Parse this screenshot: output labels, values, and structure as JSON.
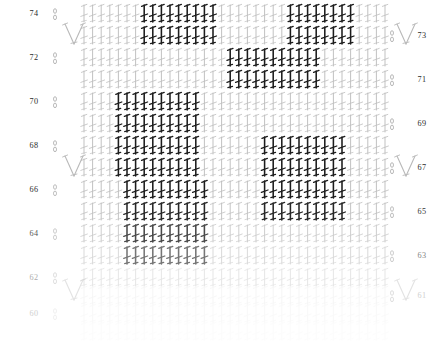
{
  "document": {
    "title": "Crochet Stitch Chart",
    "kind": "crochet-symbol-chart",
    "background": "#ffffff"
  },
  "chart_data": {
    "type": "table",
    "xlabel": "",
    "ylabel": "",
    "stitch_symbol": "double-crochet",
    "columns": 36,
    "row_count": 16,
    "row_labels_left": [
      "74",
      "72",
      "70",
      "68",
      "66",
      "64",
      "62",
      "60"
    ],
    "row_labels_right": [
      "73",
      "71",
      "69",
      "67",
      "65",
      "63",
      "61"
    ],
    "colors": {
      "dark_stitch": "#1c1c1c",
      "light_stitch": "#b9b9b9",
      "faded_stitch": "#dcdcdc",
      "label": "#2b2b2b",
      "faint_label": "#cfcfcf"
    },
    "legend": [
      {
        "symbol": "oval",
        "name": "chain-stitch",
        "color": "#8e8e8e"
      },
      {
        "symbol": "vertical-bar-with-crossbar",
        "name": "double-crochet",
        "color": "#1c1c1c"
      },
      {
        "symbol": "v-cluster",
        "name": "decrease-cluster",
        "color": "#b9b9b9"
      }
    ],
    "rows": [
      {
        "label_left": "74",
        "label_right": "",
        "y": 22,
        "opacity": 1.0,
        "dark_ranges": [
          [
            7,
            15
          ],
          [
            24,
            31
          ]
        ]
      },
      {
        "label_left": "",
        "label_right": "73",
        "y": 44,
        "opacity": 1.0,
        "dark_ranges": [
          [
            7,
            15
          ],
          [
            24,
            31
          ]
        ]
      },
      {
        "label_left": "72",
        "label_right": "",
        "y": 66,
        "opacity": 1.0,
        "dark_ranges": [
          [
            17,
            27
          ]
        ]
      },
      {
        "label_left": "",
        "label_right": "71",
        "y": 88,
        "opacity": 1.0,
        "dark_ranges": [
          [
            17,
            27
          ]
        ]
      },
      {
        "label_left": "70",
        "label_right": "",
        "y": 110,
        "opacity": 1.0,
        "dark_ranges": [
          [
            4,
            13
          ]
        ]
      },
      {
        "label_left": "",
        "label_right": "69",
        "y": 132,
        "opacity": 1.0,
        "dark_ranges": [
          [
            4,
            13
          ]
        ]
      },
      {
        "label_left": "68",
        "label_right": "",
        "y": 154,
        "opacity": 1.0,
        "dark_ranges": [
          [
            4,
            13
          ],
          [
            21,
            30
          ]
        ]
      },
      {
        "label_left": "",
        "label_right": "67",
        "y": 176,
        "opacity": 1.0,
        "dark_ranges": [
          [
            4,
            13
          ],
          [
            21,
            30
          ]
        ]
      },
      {
        "label_left": "66",
        "label_right": "",
        "y": 198,
        "opacity": 1.0,
        "dark_ranges": [
          [
            5,
            14
          ],
          [
            21,
            30
          ]
        ]
      },
      {
        "label_left": "",
        "label_right": "65",
        "y": 220,
        "opacity": 0.95,
        "dark_ranges": [
          [
            5,
            14
          ],
          [
            21,
            30
          ]
        ]
      },
      {
        "label_left": "64",
        "label_right": "",
        "y": 242,
        "opacity": 0.8,
        "dark_ranges": [
          [
            5,
            14
          ]
        ]
      },
      {
        "label_left": "",
        "label_right": "63",
        "y": 264,
        "opacity": 0.6,
        "dark_ranges": [
          [
            5,
            14
          ]
        ]
      },
      {
        "label_left": "62",
        "label_right": "",
        "y": 286,
        "opacity": 0.4,
        "dark_ranges": []
      },
      {
        "label_left": "",
        "label_right": "61",
        "y": 304,
        "opacity": 0.28,
        "dark_ranges": []
      },
      {
        "label_left": "60",
        "label_right": "",
        "y": 322,
        "opacity": 0.18,
        "dark_ranges": []
      },
      {
        "label_left": "",
        "label_right": "",
        "y": 340,
        "opacity": 0.1,
        "dark_ranges": []
      }
    ],
    "chain_marks_left": [
      {
        "y": 22,
        "opacity": 1.0
      },
      {
        "y": 66,
        "opacity": 1.0
      },
      {
        "y": 110,
        "opacity": 1.0
      },
      {
        "y": 154,
        "opacity": 1.0
      },
      {
        "y": 198,
        "opacity": 0.9
      },
      {
        "y": 242,
        "opacity": 0.7
      },
      {
        "y": 286,
        "opacity": 0.45
      },
      {
        "y": 322,
        "opacity": 0.2
      }
    ],
    "chain_marks_right": [
      {
        "y": 44,
        "opacity": 1.0
      },
      {
        "y": 88,
        "opacity": 1.0
      },
      {
        "y": 132,
        "opacity": 1.0
      },
      {
        "y": 176,
        "opacity": 1.0
      },
      {
        "y": 220,
        "opacity": 0.9
      },
      {
        "y": 264,
        "opacity": 0.7
      },
      {
        "y": 304,
        "opacity": 0.45
      }
    ],
    "clusters": [
      {
        "x": 74,
        "y": 44,
        "side": "left",
        "opacity": 1.0
      },
      {
        "x": 74,
        "y": 176,
        "side": "left",
        "opacity": 1.0
      },
      {
        "x": 74,
        "y": 300,
        "side": "left",
        "opacity": 0.4
      },
      {
        "x": 406,
        "y": 44,
        "side": "right",
        "opacity": 1.0
      },
      {
        "x": 406,
        "y": 176,
        "side": "right",
        "opacity": 1.0
      },
      {
        "x": 406,
        "y": 300,
        "side": "right",
        "opacity": 0.4
      }
    ]
  }
}
